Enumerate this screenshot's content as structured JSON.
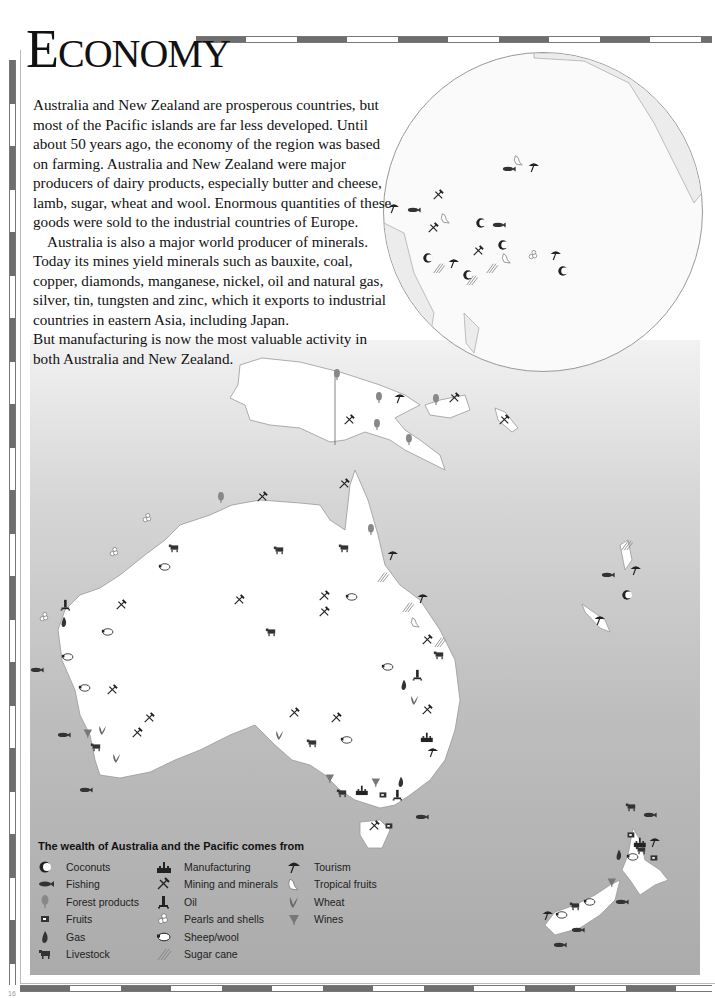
{
  "page": {
    "title_initial": "E",
    "title_rest": "CONOMY",
    "page_number": "16"
  },
  "intro": {
    "paragraphs": [
      "Australia and New Zealand are prosperous countries, but most of the Pacific islands are far less developed. Until about 50 years ago, the economy of the region was based on farming. Australia and New Zealand were major producers of dairy products, especially butter and cheese, lamb, sugar, wheat and wool. Enormous quantities of these goods were sold to the industrial countries of Europe.",
      "Australia is also a major world producer of minerals. Today its mines yield minerals such as bauxite, coal, copper, diamonds, manganese, nickel, oil and natural gas, silver, tin, tungsten and zinc, which it exports to industrial countries in eastern Asia, including Japan.",
      "But manufacturing is now the most valuable activity in both Australia and New Zealand."
    ]
  },
  "legend": {
    "title": "The wealth of Australia and the Pacific comes from",
    "columns": [
      [
        {
          "icon": "coconut-icon",
          "label": "Coconuts"
        },
        {
          "icon": "fish-icon",
          "label": "Fishing"
        },
        {
          "icon": "tree-icon",
          "label": "Forest products"
        },
        {
          "icon": "fruit-icon",
          "label": "Fruits"
        },
        {
          "icon": "gas-flame-icon",
          "label": "Gas"
        },
        {
          "icon": "cow-icon",
          "label": "Livestock"
        }
      ],
      [
        {
          "icon": "factory-icon",
          "label": "Manufacturing"
        },
        {
          "icon": "pick-hammer-icon",
          "label": "Mining and minerals"
        },
        {
          "icon": "oil-rig-icon",
          "label": "Oil"
        },
        {
          "icon": "pearl-icon",
          "label": "Pearls and shells"
        },
        {
          "icon": "sheep-icon",
          "label": "Sheep/wool"
        },
        {
          "icon": "sugar-cane-icon",
          "label": "Sugar cane"
        }
      ],
      [
        {
          "icon": "umbrella-icon",
          "label": "Tourism"
        },
        {
          "icon": "tropical-fruit-icon",
          "label": "Tropical fruits"
        },
        {
          "icon": "wheat-icon",
          "label": "Wheat"
        },
        {
          "icon": "wine-glass-icon",
          "label": "Wines"
        }
      ]
    ]
  },
  "map": {
    "regions": [
      "Australia",
      "New Zealand",
      "Papua New Guinea",
      "Pacific Islands"
    ],
    "colors": {
      "land": "#ffffff",
      "sea_light": "#f2f2f2",
      "sea_dark": "#ababab",
      "icon": "#222222",
      "icon_grey": "#777777"
    }
  }
}
